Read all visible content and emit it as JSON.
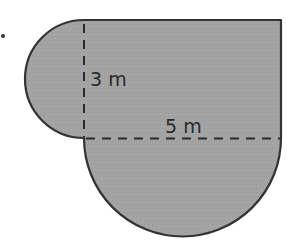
{
  "diagram": {
    "type": "composite-shape",
    "bullet": "•",
    "fill_color": "#a3a3a3",
    "stroke_color": "#333333",
    "rectangle": {
      "width_label": "5 m",
      "height_label": "3 m"
    },
    "labels": {
      "height": "3 m",
      "width": "5 m"
    },
    "shapes": [
      {
        "name": "rectangle",
        "width": "5 m",
        "height": "3 m"
      },
      {
        "name": "left-semicircle",
        "diameter": "3 m"
      },
      {
        "name": "bottom-semicircle",
        "diameter": "5 m"
      }
    ]
  }
}
